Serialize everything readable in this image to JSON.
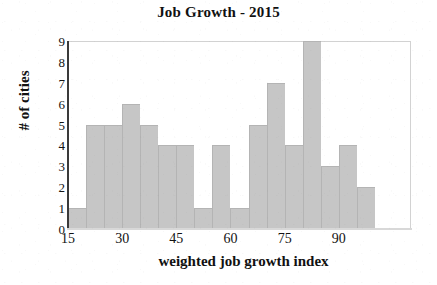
{
  "chart_data": {
    "type": "bar",
    "title": "Job Growth - 2015",
    "xlabel": "weighted job growth index",
    "ylabel": "# of cities",
    "xlim": [
      15,
      110
    ],
    "ylim": [
      0,
      9
    ],
    "grid": false,
    "legend": null,
    "bin_width": 5,
    "bin_edges": [
      15,
      20,
      25,
      30,
      35,
      40,
      45,
      50,
      55,
      60,
      65,
      70,
      75,
      80,
      85,
      90,
      95,
      100,
      105,
      110
    ],
    "categories": [
      "15-20",
      "20-25",
      "25-30",
      "30-35",
      "35-40",
      "40-45",
      "45-50",
      "50-55",
      "55-60",
      "60-65",
      "65-70",
      "70-75",
      "75-80",
      "80-85",
      "85-90",
      "90-95",
      "95-100",
      "100-105",
      "105-110"
    ],
    "values": [
      1,
      5,
      5,
      6,
      5,
      4,
      4,
      1,
      4,
      1,
      5,
      7,
      4,
      9,
      3,
      4,
      2,
      0,
      0
    ],
    "xticks": [
      15,
      30,
      45,
      60,
      75,
      90
    ],
    "xtick_labels": [
      "15",
      "30",
      "45",
      "60",
      "75",
      "90"
    ],
    "yticks": [
      0,
      1,
      2,
      3,
      4,
      5,
      6,
      7,
      8,
      9
    ],
    "ytick_labels": [
      "0",
      "1",
      "2",
      "3",
      "4",
      "5",
      "6",
      "7",
      "8",
      "9"
    ],
    "bar_color": "#c6c6c6",
    "bar_edge_color": "#b4b4b4",
    "axis_color": "#3a3a3a",
    "text_color": "#111111",
    "background_color": "#ffffff"
  }
}
